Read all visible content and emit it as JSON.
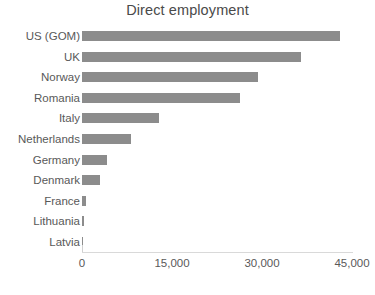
{
  "chart_data": {
    "type": "bar",
    "orientation": "horizontal",
    "title": "Direct employment",
    "xlabel": "",
    "ylabel": "",
    "categories": [
      "US (GOM)",
      "UK",
      "Norway",
      "Romania",
      "Italy",
      "Netherlands",
      "Germany",
      "Denmark",
      "France",
      "Lithuania",
      "Latvia"
    ],
    "values": [
      43000,
      36500,
      29300,
      26300,
      12800,
      8200,
      4200,
      3000,
      600,
      250,
      100
    ],
    "xlim": [
      0,
      45000
    ],
    "xticks": [
      0,
      15000,
      30000,
      45000
    ],
    "xtick_labels": [
      "0",
      "15,000",
      "30,000",
      "45,000"
    ],
    "grid": false,
    "legend": false,
    "bar_color": "#8c8c8c",
    "text_color": "#595959",
    "background": "#ffffff"
  },
  "chart": {
    "title": "Direct employment"
  }
}
